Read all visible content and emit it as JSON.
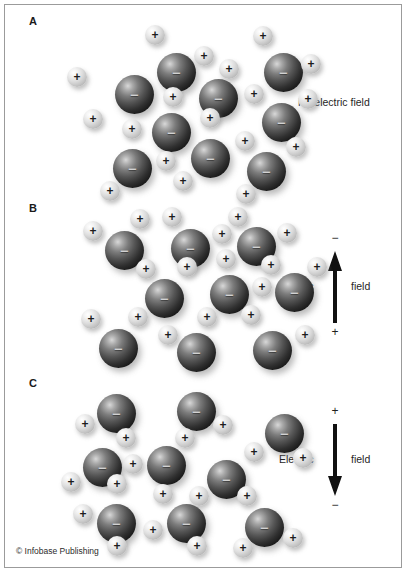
{
  "figure": {
    "credit": "© Infobase Publishing",
    "background_color": "#ffffff",
    "border_color": "#9b9b9b"
  },
  "panels": [
    {
      "id": "panel-a",
      "label": "A",
      "caption": "No electric field",
      "field": null,
      "description": "Randomly oriented polar molecules with no net alignment",
      "molecules": [
        {
          "big": {
            "x": 76,
            "y": 54,
            "sign": "−"
          },
          "smalls": [
            {
              "x": 28,
              "y": 46,
              "sign": "+"
            },
            {
              "x": 44,
              "y": 88,
              "sign": "+"
            }
          ]
        },
        {
          "big": {
            "x": 118,
            "y": 32,
            "sign": "−"
          },
          "smalls": [
            {
              "x": 106,
              "y": 4,
              "sign": "+"
            },
            {
              "x": 155,
              "y": 25,
              "sign": "+"
            }
          ]
        },
        {
          "big": {
            "x": 160,
            "y": 58,
            "sign": "−"
          },
          "smalls": [
            {
              "x": 124,
              "y": 66,
              "sign": "+"
            },
            {
              "x": 180,
              "y": 38,
              "sign": "+"
            }
          ]
        },
        {
          "big": {
            "x": 225,
            "y": 32,
            "sign": "−"
          },
          "smalls": [
            {
              "x": 214,
              "y": 5,
              "sign": "+"
            },
            {
              "x": 262,
              "y": 33,
              "sign": "+"
            }
          ]
        },
        {
          "big": {
            "x": 113,
            "y": 92,
            "sign": "−"
          },
          "smalls": [
            {
              "x": 83,
              "y": 98,
              "sign": "+"
            },
            {
              "x": 161,
              "y": 87,
              "sign": "+"
            }
          ]
        },
        {
          "big": {
            "x": 223,
            "y": 82,
            "sign": "−"
          },
          "smalls": [
            {
              "x": 205,
              "y": 63,
              "sign": "+"
            },
            {
              "x": 259,
              "y": 68,
              "sign": "+"
            }
          ]
        },
        {
          "big": {
            "x": 74,
            "y": 128,
            "sign": "−"
          },
          "smalls": [
            {
              "x": 61,
              "y": 160,
              "sign": "+"
            },
            {
              "x": 117,
              "y": 130,
              "sign": "+"
            }
          ]
        },
        {
          "big": {
            "x": 152,
            "y": 118,
            "sign": "−"
          },
          "smalls": [
            {
              "x": 134,
              "y": 150,
              "sign": "+"
            },
            {
              "x": 196,
              "y": 110,
              "sign": "+"
            }
          ]
        },
        {
          "big": {
            "x": 208,
            "y": 131,
            "sign": "−"
          },
          "smalls": [
            {
              "x": 197,
              "y": 163,
              "sign": "+"
            },
            {
              "x": 247,
              "y": 116,
              "sign": "+"
            }
          ]
        }
      ]
    },
    {
      "id": "panel-b",
      "label": "B",
      "caption": null,
      "field": {
        "word_left": "Electric",
        "word_right": "field",
        "top_pole": "−",
        "bottom_pole": "+",
        "direction": "up"
      },
      "description": "Molecules aligned with positive ends toward the upward field arrow",
      "molecules": [
        {
          "big": {
            "x": 60,
            "y": 24,
            "sign": "−"
          },
          "smalls": [
            {
              "x": 38,
              "y": 14,
              "sign": "+"
            },
            {
              "x": 85,
              "y": 2,
              "sign": "+"
            }
          ]
        },
        {
          "big": {
            "x": 126,
            "y": 22,
            "sign": "−"
          },
          "smalls": [
            {
              "x": 117,
              "y": 0,
              "sign": "+"
            },
            {
              "x": 167,
              "y": 17,
              "sign": "+"
            }
          ]
        },
        {
          "big": {
            "x": 192,
            "y": 20,
            "sign": "−"
          },
          "smalls": [
            {
              "x": 183,
              "y": 0,
              "sign": "+"
            },
            {
              "x": 232,
              "y": 16,
              "sign": "+"
            }
          ]
        },
        {
          "big": {
            "x": 100,
            "y": 72,
            "sign": "−"
          },
          "smalls": [
            {
              "x": 91,
              "y": 52,
              "sign": "+"
            },
            {
              "x": 132,
              "y": 50,
              "sign": "+"
            }
          ]
        },
        {
          "big": {
            "x": 165,
            "y": 68,
            "sign": "−"
          },
          "smalls": [
            {
              "x": 171,
              "y": 42,
              "sign": "+"
            },
            {
              "x": 207,
              "y": 70,
              "sign": "+"
            }
          ]
        },
        {
          "big": {
            "x": 230,
            "y": 66,
            "sign": "−"
          },
          "smalls": [
            {
              "x": 216,
              "y": 48,
              "sign": "+"
            },
            {
              "x": 262,
              "y": 50,
              "sign": "+"
            }
          ]
        },
        {
          "big": {
            "x": 54,
            "y": 122,
            "sign": "−"
          },
          "smalls": [
            {
              "x": 36,
              "y": 102,
              "sign": "+"
            },
            {
              "x": 83,
              "y": 100,
              "sign": "+"
            }
          ]
        },
        {
          "big": {
            "x": 132,
            "y": 126,
            "sign": "−"
          },
          "smalls": [
            {
              "x": 113,
              "y": 118,
              "sign": "+"
            },
            {
              "x": 152,
              "y": 100,
              "sign": "+"
            }
          ]
        },
        {
          "big": {
            "x": 208,
            "y": 124,
            "sign": "−"
          },
          "smalls": [
            {
              "x": 196,
              "y": 98,
              "sign": "+"
            },
            {
              "x": 250,
              "y": 118,
              "sign": "+"
            }
          ]
        }
      ]
    },
    {
      "id": "panel-c",
      "label": "C",
      "caption": null,
      "field": {
        "word_left": "Electric",
        "word_right": "field",
        "top_pole": "+",
        "bottom_pole": "−",
        "direction": "down"
      },
      "description": "Molecules aligned with positive ends toward the downward field arrow",
      "molecules": [
        {
          "big": {
            "x": 52,
            "y": 8,
            "sign": "−"
          },
          "smalls": [
            {
              "x": 30,
              "y": 28,
              "sign": "+"
            },
            {
              "x": 71,
              "y": 42,
              "sign": "+"
            }
          ]
        },
        {
          "big": {
            "x": 132,
            "y": 6,
            "sign": "−"
          },
          "smalls": [
            {
              "x": 130,
              "y": 42,
              "sign": "+"
            },
            {
              "x": 168,
              "y": 29,
              "sign": "+"
            }
          ]
        },
        {
          "big": {
            "x": 220,
            "y": 28,
            "sign": "−"
          },
          "smalls": [
            {
              "x": 199,
              "y": 56,
              "sign": "+"
            },
            {
              "x": 248,
              "y": 62,
              "sign": "+"
            }
          ]
        },
        {
          "big": {
            "x": 38,
            "y": 62,
            "sign": "−"
          },
          "smalls": [
            {
              "x": 16,
              "y": 86,
              "sign": "+"
            },
            {
              "x": 62,
              "y": 88,
              "sign": "+"
            }
          ]
        },
        {
          "big": {
            "x": 102,
            "y": 60,
            "sign": "−"
          },
          "smalls": [
            {
              "x": 78,
              "y": 68,
              "sign": "+"
            },
            {
              "x": 108,
              "y": 98,
              "sign": "+"
            }
          ]
        },
        {
          "big": {
            "x": 162,
            "y": 74,
            "sign": "−"
          },
          "smalls": [
            {
              "x": 144,
              "y": 100,
              "sign": "+"
            },
            {
              "x": 192,
              "y": 100,
              "sign": "+"
            }
          ]
        },
        {
          "big": {
            "x": 52,
            "y": 118,
            "sign": "−"
          },
          "smalls": [
            {
              "x": 28,
              "y": 118,
              "sign": "+"
            },
            {
              "x": 62,
              "y": 150,
              "sign": "+"
            }
          ]
        },
        {
          "big": {
            "x": 122,
            "y": 118,
            "sign": "−"
          },
          "smalls": [
            {
              "x": 98,
              "y": 134,
              "sign": "+"
            },
            {
              "x": 142,
              "y": 150,
              "sign": "+"
            }
          ]
        },
        {
          "big": {
            "x": 200,
            "y": 122,
            "sign": "−"
          },
          "smalls": [
            {
              "x": 188,
              "y": 152,
              "sign": "+"
            },
            {
              "x": 238,
              "y": 142,
              "sign": "+"
            }
          ]
        }
      ]
    }
  ]
}
